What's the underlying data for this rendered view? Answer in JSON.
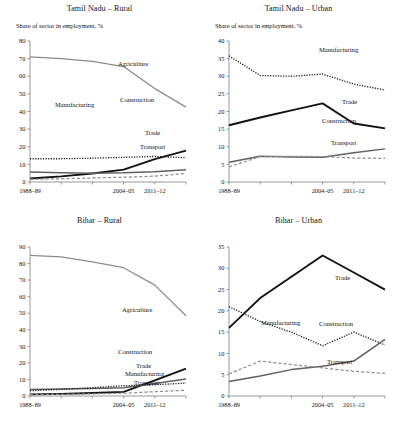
{
  "figure": {
    "axis_subtitle": "Share of sector in employment, %",
    "x_tick_labels": [
      "1988–89",
      "2004–05",
      "2011–12"
    ],
    "colors": {
      "agriculture": "#8c8c8c",
      "manufacturing": "#1a1a1a",
      "construction": "#5f5f5f",
      "trade": "#111111",
      "transport": "#8f8f8f",
      "axis": "#6f6f6f",
      "text": "#111111"
    },
    "series_labels": {
      "agriculture": "Agriculture",
      "manufacturing": "Manufacturing",
      "construction": "Construction",
      "trade": "Trade",
      "transport": "Transport"
    }
  },
  "chart_data": [
    {
      "type": "line",
      "panel": "top-left",
      "title": "Tamil Nadu – Rural",
      "subtitle": "Share of sector in employment, %",
      "xlabel": "",
      "ylabel": "",
      "x": [
        "1988–89",
        "1993–94",
        "1999–00",
        "2004–05",
        "2009–10",
        "2011–12"
      ],
      "x_tick_labels": [
        "1988–89",
        "2004–05",
        "2011–12"
      ],
      "x_tick_indices": [
        0,
        3,
        4
      ],
      "ylim": [
        0,
        80
      ],
      "yticks": [
        0,
        10,
        20,
        30,
        40,
        50,
        60,
        70,
        80
      ],
      "grid": false,
      "legend": "inline-annotations",
      "series": [
        {
          "name": "Agriculture",
          "style": "solid-thin-gray",
          "values": [
            71.0,
            70.0,
            68.5,
            65.5,
            53.0,
            42.5
          ]
        },
        {
          "name": "Manufacturing",
          "style": "dotted",
          "values": [
            13.2,
            13.2,
            13.5,
            14.0,
            14.5,
            13.8
          ]
        },
        {
          "name": "Construction",
          "style": "solid-thick",
          "values": [
            2.0,
            3.2,
            4.8,
            7.0,
            13.0,
            17.8
          ]
        },
        {
          "name": "Trade",
          "style": "solid-medium",
          "values": [
            5.7,
            5.2,
            5.0,
            5.2,
            5.8,
            7.0
          ]
        },
        {
          "name": "Transport",
          "style": "dashed",
          "values": [
            1.6,
            1.8,
            2.3,
            2.7,
            3.3,
            4.8
          ]
        }
      ]
    },
    {
      "type": "line",
      "panel": "top-right",
      "title": "Tamil Nadu – Urban",
      "subtitle": "Share of sector in employment, %",
      "xlabel": "",
      "ylabel": "",
      "x": [
        "1988–89",
        "1993–94",
        "1999–00",
        "2004–05",
        "2009–10",
        "2011–12"
      ],
      "x_tick_labels": [
        "1988–89",
        "2004–05",
        "2011–12"
      ],
      "x_tick_indices": [
        0,
        3,
        4
      ],
      "ylim": [
        0,
        40
      ],
      "yticks": [
        0,
        5,
        10,
        15,
        20,
        25,
        30,
        35,
        40
      ],
      "grid": false,
      "legend": "inline-annotations",
      "series": [
        {
          "name": "Manufacturing",
          "style": "dotted",
          "values": [
            35.8,
            30.2,
            30.0,
            30.6,
            27.8,
            26.1
          ]
        },
        {
          "name": "Trade",
          "style": "solid-thick",
          "values": [
            16.1,
            18.3,
            20.3,
            22.3,
            16.6,
            15.2
          ]
        },
        {
          "name": "Construction",
          "style": "solid-medium",
          "values": [
            5.6,
            7.3,
            7.1,
            7.0,
            8.3,
            9.4
          ]
        },
        {
          "name": "Transport",
          "style": "dashed",
          "values": [
            4.3,
            7.2,
            7.3,
            7.2,
            6.8,
            6.7
          ]
        }
      ]
    },
    {
      "type": "line",
      "panel": "bottom-left",
      "title": "Bihar – Rural",
      "subtitle": "",
      "xlabel": "",
      "ylabel": "",
      "x": [
        "1988–89",
        "1993–94",
        "1999–00",
        "2004–05",
        "2009–10",
        "2011–12"
      ],
      "x_tick_labels": [
        "1988–89",
        "2004–05",
        "2011–12"
      ],
      "x_tick_indices": [
        0,
        3,
        4
      ],
      "ylim": [
        0,
        90
      ],
      "yticks": [
        0,
        10,
        20,
        30,
        40,
        50,
        60,
        70,
        80,
        90
      ],
      "grid": false,
      "legend": "inline-annotations",
      "series": [
        {
          "name": "Agriculture",
          "style": "solid-thin-gray",
          "values": [
            85.0,
            84.0,
            81.0,
            77.5,
            67.0,
            48.5
          ]
        },
        {
          "name": "Construction",
          "style": "solid-thick",
          "values": [
            1.0,
            1.3,
            1.8,
            2.5,
            9.5,
            16.5
          ]
        },
        {
          "name": "Trade",
          "style": "solid-medium",
          "values": [
            4.0,
            4.2,
            4.5,
            5.0,
            7.5,
            10.3
          ]
        },
        {
          "name": "Manufacturing",
          "style": "dotted",
          "values": [
            3.2,
            4.0,
            5.0,
            6.2,
            6.8,
            7.8
          ]
        },
        {
          "name": "Transport",
          "style": "dashed",
          "values": [
            0.8,
            1.0,
            1.3,
            1.7,
            2.6,
            3.5
          ]
        }
      ]
    },
    {
      "type": "line",
      "panel": "bottom-right",
      "title": "Bihar – Urban",
      "subtitle": "",
      "xlabel": "",
      "ylabel": "",
      "x": [
        "1988–89",
        "1993–94",
        "1999–00",
        "2004–05",
        "2009–10",
        "2011–12"
      ],
      "x_tick_labels": [
        "1988–89",
        "2004–05",
        "2011–12"
      ],
      "x_tick_indices": [
        0,
        3,
        4
      ],
      "ylim": [
        0,
        35
      ],
      "yticks": [
        0,
        5,
        10,
        15,
        20,
        25,
        30,
        35
      ],
      "grid": false,
      "legend": "inline-annotations",
      "series": [
        {
          "name": "Trade",
          "style": "solid-thick",
          "values": [
            16.0,
            23.0,
            28.0,
            33.0,
            29.0,
            25.0
          ]
        },
        {
          "name": "Manufacturing",
          "style": "dotted",
          "values": [
            21.0,
            17.5,
            15.0,
            11.8,
            15.0,
            12.0
          ]
        },
        {
          "name": "Construction",
          "style": "solid-medium",
          "values": [
            3.4,
            4.7,
            6.2,
            7.0,
            8.2,
            13.3
          ]
        },
        {
          "name": "Transport",
          "style": "dashed",
          "values": [
            5.2,
            8.2,
            7.4,
            6.6,
            5.8,
            5.3
          ]
        }
      ]
    }
  ],
  "annotations": {
    "top-left": [
      {
        "label": "Agriculture",
        "x": 118,
        "y": 62
      },
      {
        "label": "Manufacturing",
        "x": 55,
        "y": 103
      },
      {
        "label": "Construction",
        "x": 120,
        "y": 98
      },
      {
        "label": "Trade",
        "x": 145,
        "y": 131
      },
      {
        "label": "Transport",
        "x": 140,
        "y": 145
      }
    ],
    "top-right": [
      {
        "label": "Manufacturing",
        "x": 120,
        "y": 48
      },
      {
        "label": "Trade",
        "x": 143,
        "y": 100
      },
      {
        "label": "Construction",
        "x": 123,
        "y": 119
      },
      {
        "label": "Transport",
        "x": 132,
        "y": 141
      }
    ],
    "bottom-left": [
      {
        "label": "Agriculture",
        "x": 122,
        "y": 96
      },
      {
        "label": "Construction",
        "x": 118,
        "y": 138
      },
      {
        "label": "Trade",
        "x": 136,
        "y": 152
      },
      {
        "label": "Manufacturing",
        "x": 125,
        "y": 160
      },
      {
        "label": "Transport",
        "x": 134,
        "y": 169
      }
    ],
    "bottom-right": [
      {
        "label": "Trade",
        "x": 136,
        "y": 64
      },
      {
        "label": "Manufacturing",
        "x": 62,
        "y": 109
      },
      {
        "label": "Construction",
        "x": 120,
        "y": 110
      },
      {
        "label": "Transport",
        "x": 128,
        "y": 148
      }
    ]
  }
}
